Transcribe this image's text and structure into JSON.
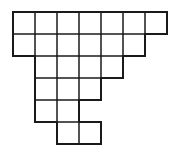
{
  "diagram": {
    "type": "cell-grid",
    "cell_size": 22,
    "origin": [
      13,
      12
    ],
    "stroke_color": "#1a1a1a",
    "rows": [
      {
        "start_col": 0,
        "length": 7
      },
      {
        "start_col": 0,
        "length": 6
      },
      {
        "start_col": 1,
        "length": 4
      },
      {
        "start_col": 1,
        "length": 3
      },
      {
        "start_col": 1,
        "length": 2
      },
      {
        "start_col": 2,
        "length": 2
      }
    ]
  }
}
